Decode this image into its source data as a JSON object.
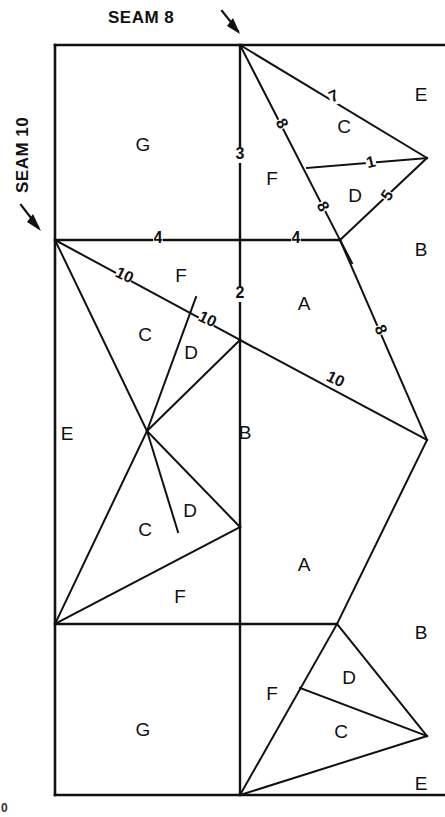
{
  "diagram": {
    "title_top": "SEAM 8",
    "title_left": "SEAM 10",
    "corner_mark": "0",
    "icons": {
      "arrow_top": "arrow-down-right-icon",
      "arrow_left": "arrow-down-right-icon"
    },
    "region_labels": [
      {
        "id": "g-top",
        "text": "G",
        "x": 143,
        "y": 146
      },
      {
        "id": "f-top",
        "text": "F",
        "x": 272,
        "y": 180
      },
      {
        "id": "c-top",
        "text": "C",
        "x": 344,
        "y": 128
      },
      {
        "id": "d-top",
        "text": "D",
        "x": 355,
        "y": 197
      },
      {
        "id": "e-top",
        "text": "E",
        "x": 421,
        "y": 96
      },
      {
        "id": "b-upper",
        "text": "B",
        "x": 421,
        "y": 251
      },
      {
        "id": "f-mid",
        "text": "F",
        "x": 181,
        "y": 277
      },
      {
        "id": "c-mid",
        "text": "C",
        "x": 145,
        "y": 336
      },
      {
        "id": "d-mid",
        "text": "D",
        "x": 191,
        "y": 354
      },
      {
        "id": "a-mid",
        "text": "A",
        "x": 304,
        "y": 305
      },
      {
        "id": "e-mid",
        "text": "E",
        "x": 67,
        "y": 435
      },
      {
        "id": "b-mid",
        "text": "B",
        "x": 245,
        "y": 434
      },
      {
        "id": "c-low",
        "text": "C",
        "x": 145,
        "y": 531
      },
      {
        "id": "d-low",
        "text": "D",
        "x": 190,
        "y": 512
      },
      {
        "id": "f-low",
        "text": "F",
        "x": 180,
        "y": 598
      },
      {
        "id": "a-low",
        "text": "A",
        "x": 304,
        "y": 566
      },
      {
        "id": "b-lower",
        "text": "B",
        "x": 421,
        "y": 634
      },
      {
        "id": "g-bottom",
        "text": "G",
        "x": 143,
        "y": 731
      },
      {
        "id": "f-bottom",
        "text": "F",
        "x": 272,
        "y": 695
      },
      {
        "id": "d-bottom",
        "text": "D",
        "x": 349,
        "y": 679
      },
      {
        "id": "c-bottom",
        "text": "C",
        "x": 341,
        "y": 733
      },
      {
        "id": "e-bottom",
        "text": "E",
        "x": 421,
        "y": 785
      }
    ],
    "seam_numbers": [
      {
        "id": "n-3",
        "text": "3",
        "x": 240,
        "y": 155,
        "rot": 0,
        "on": "center-vertical-upper"
      },
      {
        "id": "n-7",
        "text": "7",
        "x": 334,
        "y": 97,
        "rot": -24,
        "on": "top-right-upper-edge"
      },
      {
        "id": "n-8-upper",
        "text": "8",
        "x": 281,
        "y": 124,
        "rot": 62,
        "on": "seam8-diagonal-upper"
      },
      {
        "id": "n-1",
        "text": "1",
        "x": 371,
        "y": 163,
        "rot": -14,
        "on": "c-d-divider"
      },
      {
        "id": "n-5",
        "text": "5",
        "x": 388,
        "y": 196,
        "rot": -56,
        "on": "d-right-edge"
      },
      {
        "id": "n-8-lower",
        "text": "8",
        "x": 322,
        "y": 207,
        "rot": 62,
        "on": "seam8-diagonal-lower"
      },
      {
        "id": "n-4-left",
        "text": "4",
        "x": 158,
        "y": 239,
        "rot": 0,
        "on": "mid-horizontal-left"
      },
      {
        "id": "n-4-right",
        "text": "4",
        "x": 296,
        "y": 239,
        "rot": 0,
        "on": "mid-horizontal-right"
      },
      {
        "id": "n-2",
        "text": "2",
        "x": 240,
        "y": 294,
        "rot": 0,
        "on": "center-vertical-mid"
      },
      {
        "id": "n-10-a",
        "text": "10",
        "x": 124,
        "y": 276,
        "rot": 26,
        "on": "seam10-diagonal-upper"
      },
      {
        "id": "n-10-b",
        "text": "10",
        "x": 207,
        "y": 320,
        "rot": 26,
        "on": "seam10-diagonal-lower"
      },
      {
        "id": "n-10-c",
        "text": "10",
        "x": 335,
        "y": 380,
        "rot": 26,
        "on": "hub-right-diagonal"
      },
      {
        "id": "n-8-right",
        "text": "8",
        "x": 380,
        "y": 330,
        "rot": 66,
        "on": "right-upper-edge"
      }
    ]
  }
}
